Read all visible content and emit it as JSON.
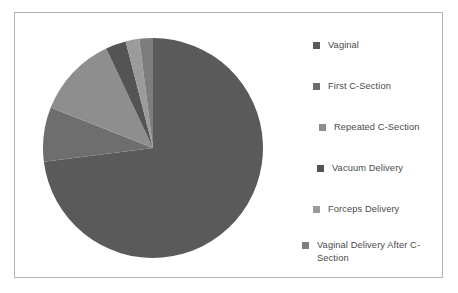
{
  "chart_data": {
    "type": "pie",
    "title": "",
    "categories": [
      "Vaginal",
      "First C-Section",
      "Repeated C-Section",
      "Vacuum Delivery",
      "Forceps Delivery",
      "Vaginal Delivery After C-Section"
    ],
    "values": [
      73,
      8,
      12,
      3,
      2,
      2
    ],
    "colors": [
      "#5a5a5a",
      "#6e6e6e",
      "#8e8e8e",
      "#545454",
      "#9b9b9b",
      "#7d7d7d"
    ],
    "legend_position": "right",
    "grid": false,
    "start_angle": 0,
    "direction": "clockwise"
  },
  "legend": {
    "items": [
      {
        "label": "Vaginal",
        "color": "#5a5a5a",
        "indent": 14,
        "top": 0
      },
      {
        "label": "First C-Section",
        "color": "#6e6e6e",
        "indent": 14,
        "top": 41
      },
      {
        "label": "Repeated C-Section",
        "color": "#8e8e8e",
        "indent": 20,
        "top": 82
      },
      {
        "label": "Vacuum Delivery",
        "color": "#545454",
        "indent": 18,
        "top": 123
      },
      {
        "label": "Forceps Delivery",
        "color": "#9b9b9b",
        "indent": 14,
        "top": 164
      },
      {
        "label": "Vaginal Delivery After C-\nSection",
        "color": "#7d7d7d",
        "indent": 3,
        "top": 200
      }
    ]
  },
  "frame": {
    "border_color": "#b4b4b4",
    "background": "#ffffff"
  }
}
